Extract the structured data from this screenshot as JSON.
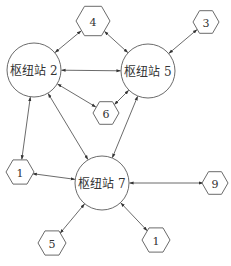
{
  "diagram": {
    "type": "network",
    "colors": {
      "stroke": "#6b6b6b",
      "edge": "#5a5a5a",
      "text": "#333333",
      "background": "#ffffff"
    },
    "hubs": [
      {
        "id": "h2",
        "label": "枢纽站 2",
        "cx": 34,
        "cy": 70,
        "r": 27
      },
      {
        "id": "h5",
        "label": "枢纽站 5",
        "cx": 148,
        "cy": 71,
        "r": 27
      },
      {
        "id": "h7",
        "label": "枢纽站 7",
        "cx": 102,
        "cy": 183,
        "r": 27
      }
    ],
    "stations": [
      {
        "id": "s4",
        "label": "4",
        "cx": 93,
        "cy": 21,
        "r": 17
      },
      {
        "id": "s3",
        "label": "3",
        "cx": 206,
        "cy": 22,
        "r": 13
      },
      {
        "id": "s6",
        "label": "6",
        "cx": 106,
        "cy": 113,
        "r": 13
      },
      {
        "id": "s1a",
        "label": "1",
        "cx": 20,
        "cy": 172,
        "r": 14
      },
      {
        "id": "s9",
        "label": "9",
        "cx": 215,
        "cy": 183,
        "r": 13
      },
      {
        "id": "s5",
        "label": "5",
        "cx": 52,
        "cy": 243,
        "r": 14
      },
      {
        "id": "s1b",
        "label": "1",
        "cx": 156,
        "cy": 240,
        "r": 14
      }
    ],
    "edges": [
      {
        "from": "h2",
        "to": "s4",
        "directed": "both"
      },
      {
        "from": "h5",
        "to": "s4",
        "directed": "both"
      },
      {
        "from": "h5",
        "to": "s3",
        "directed": "both"
      },
      {
        "from": "h2",
        "to": "h5",
        "directed": "both"
      },
      {
        "from": "h2",
        "to": "s6",
        "directed": "both"
      },
      {
        "from": "h5",
        "to": "s6",
        "directed": "both"
      },
      {
        "from": "h2",
        "to": "s1a",
        "directed": "both"
      },
      {
        "from": "h2",
        "to": "h7",
        "directed": "both"
      },
      {
        "from": "h5",
        "to": "h7",
        "directed": "both"
      },
      {
        "from": "h7",
        "to": "s1a",
        "directed": "both"
      },
      {
        "from": "h7",
        "to": "s9",
        "directed": "both"
      },
      {
        "from": "h7",
        "to": "s5",
        "directed": "both"
      },
      {
        "from": "h7",
        "to": "s1b",
        "directed": "both"
      }
    ]
  }
}
